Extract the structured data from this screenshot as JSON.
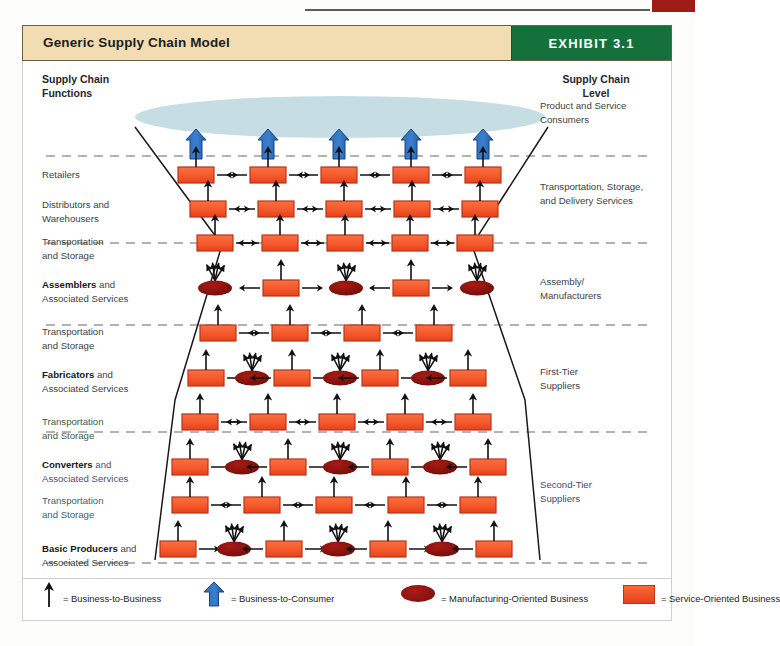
{
  "page": {
    "top_rule": "decorative-rule",
    "top_red_bar": "decorative-red-tab"
  },
  "header": {
    "title": "Generic Supply Chain Model",
    "exhibit_label": "EXHIBIT 3.1",
    "bar_color": "#f2dcb2",
    "exhibit_color": "#14713c"
  },
  "columns": {
    "left_heading_line1": "Supply Chain",
    "left_heading_line2": "Functions",
    "right_heading_line1": "Supply Chain",
    "right_heading_line2": "Level"
  },
  "functions": [
    {
      "bold": "",
      "rest": "Retailers",
      "line2": ""
    },
    {
      "bold": "",
      "rest": "Distributors and",
      "line2": "Warehousers"
    },
    {
      "bold": "",
      "rest": "Transportation",
      "line2": "and Storage"
    },
    {
      "bold": "Assemblers",
      "rest": " and",
      "line2": "Associated Services"
    },
    {
      "bold": "",
      "rest": "Transportation",
      "line2": "and Storage"
    },
    {
      "bold": "Fabricators",
      "rest": " and",
      "line2": "Associated Services"
    },
    {
      "bold": "",
      "rest": "Transportation",
      "line2": "and Storage"
    },
    {
      "bold": "Converters",
      "rest": " and",
      "line2": "Associated Services"
    },
    {
      "bold": "",
      "rest": "Transportation",
      "line2": "and Storage"
    },
    {
      "bold": "Basic Producers",
      "rest": " and",
      "line2": "Associated Services"
    }
  ],
  "levels": [
    {
      "line1": "Product and Service",
      "line2": "Consumers"
    },
    {
      "line1": "Transportation, Storage,",
      "line2": "and Delivery Services"
    },
    {
      "line1": "Assembly/",
      "line2": "Manufacturers"
    },
    {
      "line1": "First-Tier",
      "line2": "Suppliers"
    },
    {
      "line1": "Second-Tier",
      "line2": "Suppliers"
    }
  ],
  "legend": [
    {
      "icon": "thin-black-arrow-up",
      "text": "= Business-to-Business"
    },
    {
      "icon": "thick-blue-arrow-up",
      "text": "= Business-to-Consumer"
    },
    {
      "icon": "dark-red-oval",
      "text": "= Manufacturing-Oriented Business"
    },
    {
      "icon": "orange-rectangle",
      "text": "= Service-Oriented Business"
    }
  ],
  "colors": {
    "service_box_fill": "#f4582c",
    "service_box_stroke": "#b8341a",
    "manufacturing_oval_fill": "#8e1410",
    "consumer_arrow_blue": "#2f6fc0",
    "consumer_cloud": "#bcd8de",
    "divider_dash": "#9a9a9a",
    "trapezoid_stroke": "#1a1a1a"
  },
  "chart_data": {
    "type": "diagram",
    "title": "Generic Supply Chain Model",
    "consumer_cloud": {
      "cx": 340,
      "cy": 117,
      "rx": 205,
      "ry": 21
    },
    "trapezoid": {
      "points": "135,127 222,245 175,400 155,560 540,560 525,400 472,245 548,127"
    },
    "dividers": [
      {
        "y": 156,
        "label": "Product and Service Consumers / Retailers"
      },
      {
        "y": 243,
        "label": "Transportation, Storage and Delivery Services"
      },
      {
        "y": 325,
        "label": "Assembly / Manufacturers"
      },
      {
        "y": 432,
        "label": "First-Tier Suppliers"
      },
      {
        "y": 563,
        "label": "Second-Tier Suppliers"
      }
    ],
    "rows": [
      {
        "y": 175,
        "label": "Retailers",
        "nodes": [
          "rect",
          "rect",
          "rect",
          "rect",
          "rect"
        ],
        "xs": [
          196,
          268,
          339,
          411,
          483
        ],
        "consumer_arrows": [
          196,
          268,
          339,
          411,
          483
        ]
      },
      {
        "y": 209,
        "label": "Distributors and Warehousers",
        "nodes": [
          "rect",
          "rect",
          "rect",
          "rect",
          "rect"
        ],
        "xs": [
          208,
          276,
          344,
          412,
          480
        ]
      },
      {
        "y": 243,
        "label": "Transportation and Storage",
        "nodes": [
          "rect",
          "rect",
          "rect",
          "rect",
          "rect"
        ],
        "xs": [
          215,
          280,
          345,
          410,
          475
        ]
      },
      {
        "y": 288,
        "label": "Assemblers and Associated Services",
        "nodes": [
          "oval",
          "rect",
          "oval",
          "rect",
          "oval"
        ],
        "xs": [
          215,
          281,
          346,
          411,
          477
        ]
      },
      {
        "y": 333,
        "label": "Transportation and Storage",
        "nodes": [
          "rect",
          "rect",
          "rect",
          "rect"
        ],
        "xs": [
          218,
          290,
          362,
          434
        ]
      },
      {
        "y": 378,
        "label": "Fabricators and Associated Services",
        "nodes": [
          "rect",
          "oval",
          "rect",
          "oval",
          "rect",
          "oval",
          "rect"
        ],
        "xs": [
          206,
          252,
          292,
          340,
          380,
          428,
          468
        ]
      },
      {
        "y": 422,
        "label": "Transportation and Storage",
        "nodes": [
          "rect",
          "rect",
          "rect",
          "rect",
          "rect"
        ],
        "xs": [
          200,
          268,
          337,
          405,
          473
        ]
      },
      {
        "y": 467,
        "label": "Converters and Associated Services",
        "nodes": [
          "rect",
          "oval",
          "rect",
          "oval",
          "rect",
          "oval",
          "rect"
        ],
        "xs": [
          190,
          242,
          288,
          340,
          390,
          440,
          488
        ]
      },
      {
        "y": 505,
        "label": "Transportation and Storage",
        "nodes": [
          "rect",
          "rect",
          "rect",
          "rect",
          "rect"
        ],
        "xs": [
          190,
          262,
          334,
          406,
          478
        ]
      },
      {
        "y": 549,
        "label": "Basic Producers and Associated Services",
        "nodes": [
          "rect",
          "oval",
          "rect",
          "oval",
          "rect",
          "oval",
          "rect"
        ],
        "xs": [
          178,
          234,
          284,
          338,
          388,
          442,
          494
        ]
      }
    ]
  }
}
